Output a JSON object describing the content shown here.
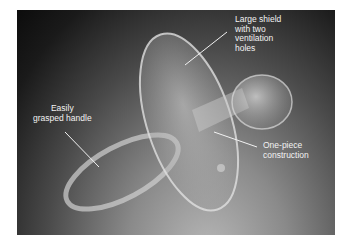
{
  "figure": {
    "callouts": [
      {
        "id": "shield",
        "lines": [
          "Large shield",
          "with two",
          "ventilation",
          "holes"
        ]
      },
      {
        "id": "handle",
        "lines": [
          "Easily",
          "grasped handle"
        ]
      },
      {
        "id": "construction",
        "lines": [
          "One-piece",
          "construction"
        ]
      }
    ]
  }
}
